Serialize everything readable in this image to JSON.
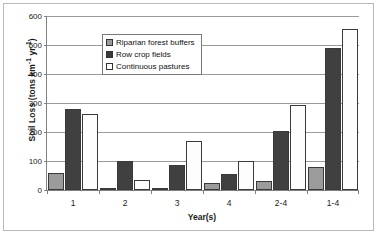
{
  "chart_data": {
    "type": "bar",
    "title": "",
    "xlabel": "Year(s)",
    "ylabel": "Soil Loss (tons km-1 yr-1)",
    "ylabel_parts": {
      "prefix": "Soil Loss (tons km",
      "sup1": "-1",
      "mid": " yr",
      "sup2": "-1",
      "suffix": ")"
    },
    "categories": [
      "1",
      "2",
      "3",
      "4",
      "2-4",
      "1-4"
    ],
    "ylim": [
      0,
      600
    ],
    "ytick_values": [
      0,
      100,
      200,
      300,
      400,
      500,
      600
    ],
    "ytick_labels": [
      "0",
      "100",
      "200",
      "300",
      "400",
      "500",
      "600"
    ],
    "grid": true,
    "legend_position": "top-left inside plot",
    "series": [
      {
        "name": "Riparian forest buffers",
        "color": "#9b9b9b",
        "values": [
          60,
          5,
          8,
          25,
          30,
          80
        ]
      },
      {
        "name": "Row crop fields",
        "color": "#404040",
        "values": [
          280,
          100,
          85,
          55,
          205,
          490
        ]
      },
      {
        "name": "Continuous pastures",
        "color": "#ffffff",
        "values": [
          262,
          35,
          170,
          100,
          293,
          555
        ]
      }
    ]
  },
  "legend": {
    "items": [
      {
        "label": "Riparian forest buffers"
      },
      {
        "label": "Row crop fields"
      },
      {
        "label": "Continuous pastures"
      }
    ]
  }
}
